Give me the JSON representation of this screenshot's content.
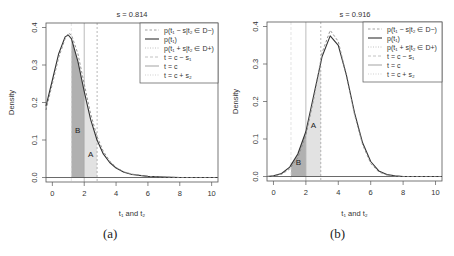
{
  "chart_data": [
    {
      "type": "line",
      "panel": "(a)",
      "title": "s = 0.814",
      "xlabel": "t₁ and t₂",
      "ylabel": "Density",
      "xlim": [
        -0.4,
        10.4
      ],
      "ylim": [
        -0.012,
        0.412
      ],
      "xticks": [
        0,
        2,
        4,
        6,
        8,
        10
      ],
      "yticks": [
        "0.0",
        "0.1",
        "0.2",
        "0.3",
        "0.4"
      ],
      "legend": {
        "position": "topright",
        "entries": [
          {
            "label": "p(t₁ − s|t₂ ∈ D−)",
            "style": "dashed",
            "color": "#888888"
          },
          {
            "label": "p(t₁)",
            "style": "solid",
            "color": "#333333"
          },
          {
            "label": "p(t₁ + s|t₂ ∈ D+)",
            "style": "dotted",
            "color": "#aaaaaa"
          },
          {
            "label": "t = c − s₁",
            "style": "dashed",
            "color": "#bbbbbb"
          },
          {
            "label": "t = c",
            "style": "solid",
            "color": "#999999"
          },
          {
            "label": "t = c + s₂",
            "style": "dotted",
            "color": "#cccccc"
          }
        ]
      },
      "vlines": {
        "c_minus_s1": 1.19,
        "c": 2.0,
        "c_plus_s2": 2.81
      },
      "regions": [
        {
          "label": "B",
          "from": 1.19,
          "to": 2.0,
          "color": "#b0b0b0"
        },
        {
          "label": "A",
          "from": 2.0,
          "to": 2.81,
          "color": "#e2e2e2"
        }
      ],
      "series": [
        {
          "name": "p(t1)",
          "x": [
            -0.4,
            0,
            0.4,
            0.8,
            1.0,
            1.2,
            1.6,
            2.0,
            2.4,
            2.8,
            3.2,
            3.6,
            4.0,
            4.5,
            5.0,
            6,
            7,
            8,
            9,
            10,
            10.4
          ],
          "values": [
            0.19,
            0.26,
            0.33,
            0.375,
            0.38,
            0.37,
            0.31,
            0.23,
            0.155,
            0.1,
            0.063,
            0.04,
            0.025,
            0.014,
            0.008,
            0.003,
            0.001,
            0.0,
            0.0,
            0.0,
            0.0
          ]
        },
        {
          "name": "p(t1 - s | t2 in D-)",
          "x": [
            -0.4,
            0,
            0.4,
            0.8,
            1.0,
            1.2,
            1.6,
            2.0,
            2.4,
            2.8,
            3.2,
            3.6,
            4.0,
            4.5,
            5.0,
            6,
            7,
            8,
            9,
            10,
            10.4
          ],
          "values": [
            0.18,
            0.25,
            0.32,
            0.37,
            0.385,
            0.38,
            0.33,
            0.25,
            0.17,
            0.11,
            0.07,
            0.044,
            0.027,
            0.015,
            0.009,
            0.003,
            0.001,
            0.0,
            0.0,
            0.0,
            0.0
          ]
        }
      ]
    },
    {
      "type": "line",
      "panel": "(b)",
      "title": "s = 0.916",
      "xlabel": "t₁ and t₂",
      "ylabel": "Density",
      "xlim": [
        -0.4,
        10.4
      ],
      "ylim": [
        -0.012,
        0.412
      ],
      "xticks": [
        0,
        2,
        4,
        6,
        8,
        10
      ],
      "yticks": [
        "0.0",
        "0.1",
        "0.2",
        "0.3",
        "0.4"
      ],
      "legend": {
        "position": "topright",
        "entries": [
          {
            "label": "p(t₁ − s|t₂ ∈ D−)",
            "style": "dashed",
            "color": "#888888"
          },
          {
            "label": "p(t₁)",
            "style": "solid",
            "color": "#333333"
          },
          {
            "label": "p(t₁ + s|t₂ ∈ D+)",
            "style": "dotted",
            "color": "#aaaaaa"
          },
          {
            "label": "t = c − s₁",
            "style": "dashed",
            "color": "#bbbbbb"
          },
          {
            "label": "t = c",
            "style": "solid",
            "color": "#999999"
          },
          {
            "label": "t = c + s₂",
            "style": "dotted",
            "color": "#cccccc"
          }
        ]
      },
      "vlines": {
        "c_minus_s1": 1.08,
        "c": 2.0,
        "c_plus_s2": 2.92
      },
      "regions": [
        {
          "label": "B",
          "from": 1.08,
          "to": 2.0,
          "color": "#b0b0b0"
        },
        {
          "label": "A",
          "from": 2.0,
          "to": 2.92,
          "color": "#e2e2e2"
        }
      ],
      "series": [
        {
          "name": "p(t1)",
          "x": [
            -0.4,
            0,
            0.5,
            1.0,
            1.5,
            2.0,
            2.5,
            3.0,
            3.5,
            4.0,
            4.5,
            5.0,
            5.5,
            6.0,
            6.5,
            7.0,
            7.5,
            8,
            9,
            10,
            10.4
          ],
          "values": [
            0.0,
            0.002,
            0.008,
            0.025,
            0.06,
            0.12,
            0.22,
            0.32,
            0.375,
            0.35,
            0.27,
            0.17,
            0.09,
            0.04,
            0.015,
            0.005,
            0.002,
            0.0,
            0.0,
            0.0,
            0.0
          ]
        },
        {
          "name": "p(t1 - s | t2 in D-)",
          "x": [
            -0.4,
            0,
            0.5,
            1.0,
            1.5,
            2.0,
            2.5,
            3.0,
            3.5,
            4.0,
            4.5,
            5.0,
            5.5,
            6.0,
            6.5,
            7.0,
            7.5,
            8,
            9,
            10,
            10.4
          ],
          "values": [
            0.0,
            0.001,
            0.006,
            0.02,
            0.05,
            0.11,
            0.21,
            0.33,
            0.39,
            0.36,
            0.27,
            0.165,
            0.085,
            0.035,
            0.012,
            0.004,
            0.001,
            0.0,
            0.0,
            0.0,
            0.0
          ]
        }
      ]
    }
  ],
  "captions": {
    "a": "(a)",
    "b": "(b)"
  },
  "labels": {
    "panel_a": {
      "title": "s = 0.814",
      "xlabel": "t₁ and t₂",
      "ylabel": "Density",
      "region_a": "A",
      "region_b": "B"
    },
    "panel_b": {
      "title": "s = 0.916",
      "xlabel": "t₁ and t₂",
      "ylabel": "Density",
      "region_a": "A",
      "region_b": "B"
    }
  }
}
